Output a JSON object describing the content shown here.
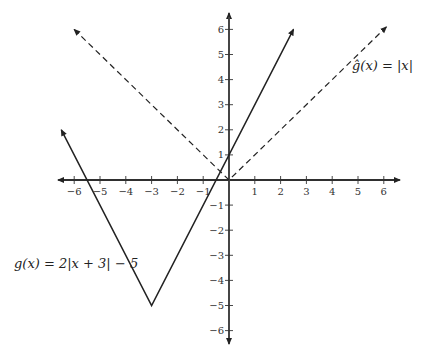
{
  "chart_data": {
    "type": "line",
    "title": "",
    "xlabel": "",
    "ylabel": "",
    "xlim": [
      -6.5,
      6.5
    ],
    "ylim": [
      -6.5,
      6.5
    ],
    "grid": false,
    "x_ticks": [
      -6,
      -5,
      -4,
      -3,
      -2,
      -1,
      1,
      2,
      3,
      4,
      5,
      6
    ],
    "y_ticks": [
      -6,
      -5,
      -4,
      -3,
      -2,
      -1,
      1,
      2,
      3,
      4,
      5,
      6
    ],
    "series": [
      {
        "name": "g(x) = 2|x + 3| − 5",
        "style": "solid",
        "points": [
          [
            -6.5,
            2
          ],
          [
            -3,
            -5
          ],
          [
            2.5,
            6
          ]
        ]
      },
      {
        "name": "ĝ(x) = |x|",
        "style": "dashed",
        "points": [
          [
            -6,
            6
          ],
          [
            0,
            0
          ],
          [
            6.1,
            6.1
          ]
        ]
      }
    ],
    "annotations": [
      {
        "text": "g(x) = 2|x + 3| − 5",
        "position": "left, near y=-2.5"
      },
      {
        "text": "ĝ(x) = |x|",
        "position": "upper right, near y=4.5"
      }
    ]
  },
  "labels": {
    "g": "g(x) = 2|x + 3| − 5",
    "ghat": "ĝ(x) = |x|"
  }
}
